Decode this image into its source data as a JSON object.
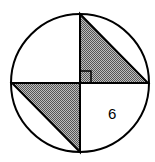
{
  "diagram": {
    "label": "6",
    "fill_color": "#8a8a8a",
    "stroke_color": "#000000"
  }
}
